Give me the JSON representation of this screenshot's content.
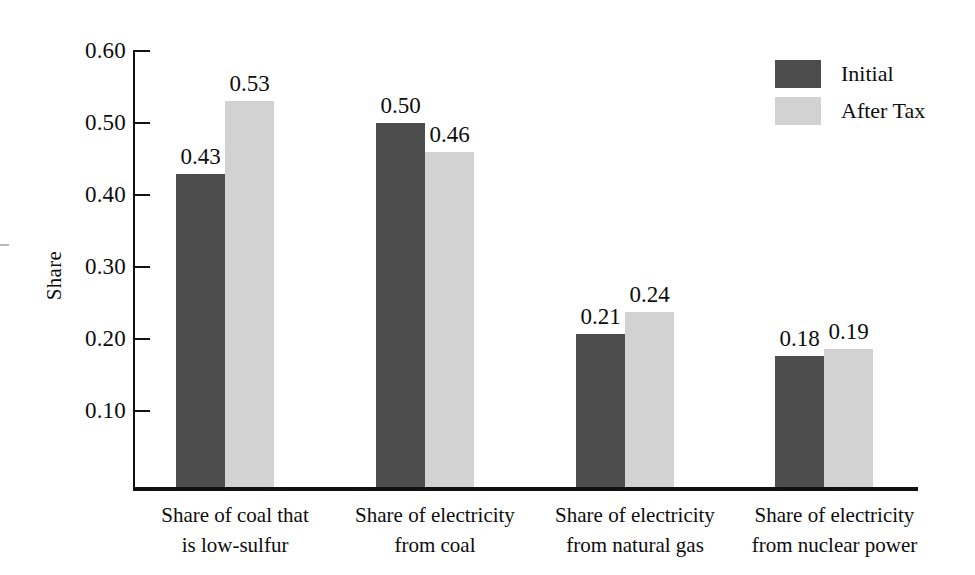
{
  "chart_data": {
    "type": "bar",
    "title": "",
    "subtitle": "",
    "xlabel": "",
    "ylabel": "Share",
    "ylim": [
      0.0,
      0.6
    ],
    "ytick_values": [
      0.1,
      0.2,
      0.3,
      0.4,
      0.5,
      0.6
    ],
    "ytick_labels": [
      "0.10",
      "0.20",
      "0.30",
      "0.40",
      "0.50",
      "0.60"
    ],
    "grid": false,
    "legend_position": "top-right",
    "categories": [
      "Share of coal that is low-sulfur",
      "Share of electricity from coal",
      "Share of electricity from natural gas",
      "Share of electricity from nuclear power"
    ],
    "category_lines": [
      [
        "Share of coal that",
        "is low-sulfur"
      ],
      [
        "Share of electricity",
        "from coal"
      ],
      [
        "Share of electricity",
        "from natural gas"
      ],
      [
        "Share of electricity",
        "from nuclear power"
      ]
    ],
    "series": [
      {
        "name": "Initial",
        "color": "#4d4d4d",
        "values": [
          0.43,
          0.5,
          0.21,
          0.18
        ],
        "value_labels": [
          "0.43",
          "0.50",
          "0.21",
          "0.18"
        ]
      },
      {
        "name": "After Tax",
        "color": "#d2d2d2",
        "values": [
          0.53,
          0.46,
          0.24,
          0.19
        ],
        "value_labels": [
          "0.53",
          "0.46",
          "0.24",
          "0.19"
        ]
      }
    ]
  },
  "legend": {
    "items": [
      {
        "label": "Initial",
        "color": "#4d4d4d"
      },
      {
        "label": "After Tax",
        "color": "#d2d2d2"
      }
    ]
  },
  "axis": {
    "y_title": "Share",
    "ticks": [
      "0.60",
      "0.50",
      "0.40",
      "0.30",
      "0.20",
      "0.10"
    ]
  }
}
